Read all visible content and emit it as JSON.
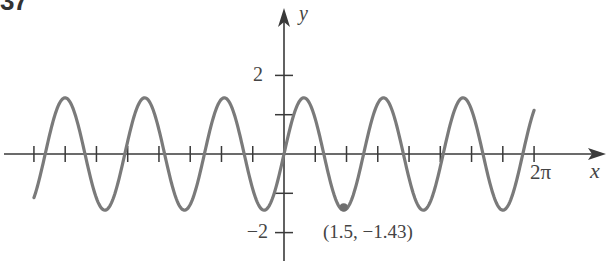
{
  "problem_number": "37",
  "chart_data": {
    "type": "line",
    "title": "",
    "xlabel": "x",
    "ylabel": "y",
    "function": "1.43*sin(pi*x)",
    "domain": [
      -6.2832,
      6.2832
    ],
    "xlim": [
      -7.1,
      8.0
    ],
    "ylim": [
      -2.4,
      3.9
    ],
    "grid": false,
    "x_ticks_step": "pi/4",
    "x_tick_labels": [
      {
        "x": 6.2832,
        "label": "2π"
      }
    ],
    "y_ticks": [
      -2,
      -1,
      1,
      2
    ],
    "y_tick_labels": [
      {
        "y": 2,
        "label": "2"
      },
      {
        "y": -2,
        "label": "−2"
      }
    ],
    "series": [
      {
        "name": "f(x)",
        "color": "#7a7a7a",
        "x": [
          -6.2832,
          -5.5,
          -5.0,
          -4.5,
          -4.0,
          -3.5,
          -3.0,
          -2.5,
          -2.0,
          -1.5,
          -1.0,
          -0.5,
          0.0,
          0.5,
          1.0,
          1.5,
          2.0,
          2.5,
          3.0,
          3.5,
          4.0,
          4.5,
          5.0,
          5.5,
          6.0,
          6.2832
        ],
        "y": [
          -1.11,
          -1.43,
          0,
          1.43,
          0,
          -1.43,
          0,
          1.43,
          0,
          -1.43,
          0,
          1.43,
          0,
          1.43,
          0,
          -1.43,
          0,
          1.43,
          0,
          -1.43,
          0,
          1.43,
          0,
          -1.43,
          0,
          1.11
        ]
      }
    ],
    "annotations": [
      {
        "x": 1.5,
        "y": -1.43,
        "text": "(1.5, −1.43)",
        "marker": "dot"
      }
    ]
  },
  "colors": {
    "axis": "#3a3a3a",
    "curve": "#7a7a7a",
    "text": "#444444",
    "marker": "#6e6e6e"
  }
}
